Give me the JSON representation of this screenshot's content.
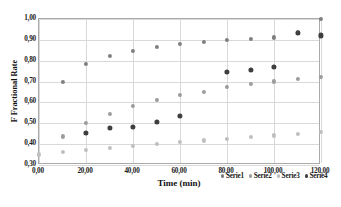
{
  "chart_data": {
    "type": "scatter",
    "title": "",
    "xlabel": "Time (min)",
    "ylabel": "F Fractional Rate",
    "xlim": [
      0,
      120
    ],
    "ylim": [
      0.3,
      1.0
    ],
    "grid": true,
    "legend_position": "inside-bottom-right",
    "xticks": [
      "0,00",
      "20,00",
      "40,00",
      "60,00",
      "80,00",
      "100,00",
      "120,00"
    ],
    "xtick_values": [
      0,
      20,
      40,
      60,
      80,
      100,
      120
    ],
    "yticks": [
      "0,30",
      "0,40",
      "0,50",
      "0,60",
      "0,70",
      "0,80",
      "0,90",
      "1,00"
    ],
    "ytick_values": [
      0.3,
      0.4,
      0.5,
      0.6,
      0.7,
      0.8,
      0.9,
      1.0
    ],
    "x": [
      0,
      10,
      20,
      30,
      40,
      50,
      60,
      70,
      80,
      90,
      100,
      110,
      120
    ],
    "series": [
      {
        "name": "Serie1",
        "color": "#7f7f7f",
        "values": [
          null,
          0.7,
          0.783,
          0.822,
          0.848,
          0.866,
          0.879,
          0.89,
          0.899,
          0.906,
          0.912,
          0.936,
          0.999
        ]
      },
      {
        "name": "Serie2",
        "color": "#9c9c9c",
        "values": [
          null,
          0.437,
          0.5,
          0.545,
          0.584,
          0.613,
          0.638,
          0.651,
          0.673,
          0.689,
          0.701,
          0.713,
          0.724
        ]
      },
      {
        "name": "Serie3",
        "color": "#bfbfbf",
        "values": [
          0.351,
          0.362,
          0.372,
          0.382,
          0.393,
          0.402,
          0.411,
          0.418,
          0.427,
          0.434,
          0.442,
          0.451,
          0.459
        ]
      },
      {
        "name": "Serie4",
        "color": "#3f3f3f",
        "values": [
          null,
          null,
          0.453,
          0.477,
          0.481,
          0.508,
          0.537,
          null,
          0.746,
          0.755,
          0.772,
          0.934,
          0.921
        ]
      }
    ]
  }
}
